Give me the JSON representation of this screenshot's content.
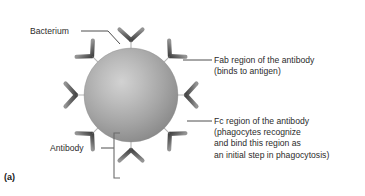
{
  "figure": {
    "panel_letter": "(a)",
    "background_color": "#ffffff",
    "text_color": "#2b2b2b"
  },
  "labels": {
    "bacterium": "Bacterium",
    "antibody": "Antibody",
    "fab_region": "Fab region of the antibody\n(binds to antigen)",
    "fc_region": "Fc region of the antibody\n(phagocytes recognize\nand bind this region as\nan initial step in phagocytosis)"
  },
  "diagram": {
    "bacterium": {
      "name": "bacterium-cell",
      "center_x": 131,
      "center_y": 95,
      "radius": 47,
      "fill_light": "#c9c9c9",
      "fill_mid": "#a6a6a6",
      "fill_dark": "#7d7d7d",
      "highlight_x": 114,
      "highlight_y": 82
    },
    "antibody": {
      "name": "antibody-y-shape",
      "count": 8,
      "arm_color_light": "#8d8d8d",
      "arm_color_dark": "#4a4a4a",
      "stem_color": "#555555",
      "angles_deg": [
        270,
        315,
        0,
        45,
        90,
        135,
        180,
        225
      ]
    },
    "leaders": {
      "color": "#3a3a3a",
      "width": 0.9
    },
    "bracket": {
      "name": "antibody-bracket",
      "x": 114,
      "top": 133,
      "bottom": 178,
      "arm": 6,
      "color": "#6b6b6b"
    }
  }
}
